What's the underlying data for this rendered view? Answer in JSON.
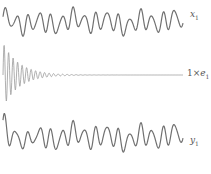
{
  "chart_data": {
    "type": "line",
    "title": "",
    "xlabel": "",
    "ylabel": "",
    "grid": false,
    "axes_visible": false,
    "line_color": "#707070",
    "series": [
      {
        "name": "x1",
        "label_var": "x",
        "label_sub": "1",
        "description": "sustained quasi-periodic oscillation (chaotic drive signal)",
        "center_y": 22,
        "amplitude": 13,
        "x_range_px": [
          3,
          183
        ],
        "cycles": 16,
        "decay": 0
      },
      {
        "name": "1×e1",
        "label_prefix": "1×",
        "label_var": "e",
        "label_sub": "1",
        "description": "synchronization error decaying rapidly to zero",
        "center_y": 75,
        "amplitude": 32,
        "x_range_px": [
          3,
          183
        ],
        "cycles": 40,
        "decay": 0.09
      },
      {
        "name": "y1",
        "label_var": "y",
        "label_sub": "1",
        "description": "response signal converging to x1 after initial transient",
        "center_y": 137,
        "amplitude": 14,
        "x_range_px": [
          3,
          183
        ],
        "cycles": 16,
        "decay": 0,
        "transient_amplitude": 12
      }
    ]
  }
}
